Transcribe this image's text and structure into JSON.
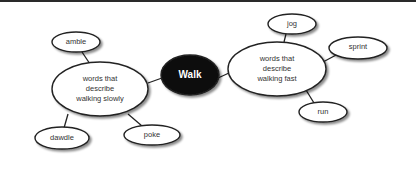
{
  "diagram": {
    "type": "concept-map",
    "center": {
      "label": "Walk"
    },
    "branches": [
      {
        "label": "words that describe walking slowly",
        "lines": [
          "words that",
          "describe",
          "walking slowly"
        ],
        "children": [
          "amble",
          "dawdle",
          "poke"
        ]
      },
      {
        "label": "words that describe walking fast",
        "lines": [
          "words that",
          "describe",
          "walking fast"
        ],
        "children": [
          "jog",
          "sprint",
          "run"
        ]
      }
    ]
  },
  "colors": {
    "center_fill": "#111111",
    "node_fill": "#ffffff",
    "stroke": "#222222"
  }
}
